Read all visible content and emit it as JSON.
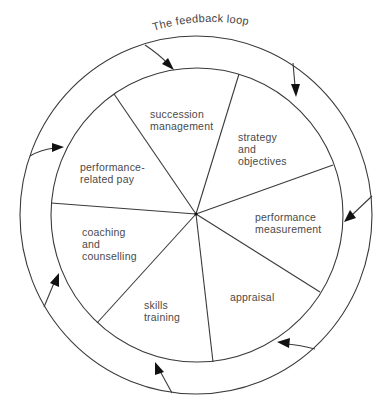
{
  "diagram": {
    "title": "The feedback loop",
    "colors": {
      "stroke": "#3a3a3a",
      "text": "#4a4a4a",
      "arrowhead": "#111111",
      "background": "#ffffff"
    },
    "segments": [
      {
        "id": "succession-management",
        "lines": [
          "succession",
          "management"
        ]
      },
      {
        "id": "strategy-and-objectives",
        "lines": [
          "strategy",
          "and",
          "objectives"
        ]
      },
      {
        "id": "performance-measurement",
        "lines": [
          "performance",
          "measurement"
        ]
      },
      {
        "id": "appraisal",
        "lines": [
          "appraisal"
        ]
      },
      {
        "id": "skills-training",
        "lines": [
          "skills",
          "training"
        ]
      },
      {
        "id": "coaching-and-counselling",
        "lines": [
          "coaching",
          "and",
          "counselling"
        ]
      },
      {
        "id": "performance-related-pay",
        "lines": [
          "performance-",
          "related pay"
        ]
      }
    ]
  }
}
